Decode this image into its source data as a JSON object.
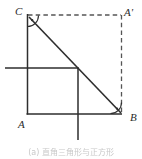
{
  "figure": {
    "colors": {
      "ink": "#3a3a3a",
      "solid_line": "#2e2e2e",
      "dashed_line": "#555555",
      "background": "#ffffff",
      "caption": "#9a9a9a"
    },
    "labels": {
      "C": "C",
      "A_prime": "A'",
      "B": "B",
      "A": "A"
    },
    "caption": "(a) 直角三角形与正方形",
    "annotations": {
      "right_angle_at_C": "right-angle-mark",
      "right_angle_at_B": "right-angle-mark"
    },
    "geometry": {
      "points": {
        "C": [
          27,
          15
        ],
        "A_prime": [
          122,
          15
        ],
        "B": [
          122,
          114
        ],
        "square_top_left": [
          27,
          15
        ],
        "square_bottom_left": [
          27,
          114
        ],
        "square_bottom_right": [
          78,
          114
        ],
        "inner_cross_horizontal_y": 68,
        "inner_cross_vertical_x": 78
      },
      "segments": [
        {
          "name": "hypotenuse-CB",
          "from": "C",
          "to": "B",
          "style": "solid"
        },
        {
          "name": "dashed-C-to-Aprime",
          "from": "C",
          "to": "A_prime",
          "style": "dashed"
        },
        {
          "name": "dashed-Aprime-to-B",
          "from": "A_prime",
          "to": "B",
          "style": "dashed"
        },
        {
          "name": "vertical-left-edge",
          "from": [
            27,
            15
          ],
          "to": [
            27,
            114
          ],
          "style": "solid"
        },
        {
          "name": "horizontal-bottom-edge",
          "from": [
            27,
            114
          ],
          "to": [
            122,
            114
          ],
          "style": "solid"
        },
        {
          "name": "horizontal-mid-line",
          "from": [
            5,
            68
          ],
          "to": [
            78,
            68
          ],
          "style": "solid"
        },
        {
          "name": "vertical-mid-line",
          "from": [
            78,
            68
          ],
          "to": [
            78,
            140
          ],
          "style": "solid"
        }
      ]
    }
  }
}
